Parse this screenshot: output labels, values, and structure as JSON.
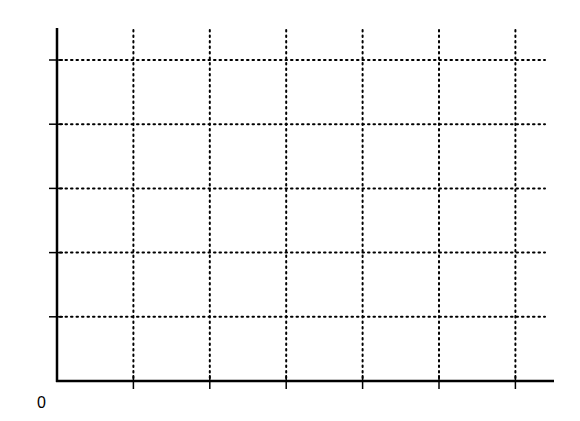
{
  "chart_data": {
    "type": "line",
    "title": "",
    "xlabel": "",
    "ylabel": "",
    "origin_label": "0",
    "x_gridlines": 6,
    "y_gridlines": 5,
    "xlim": [
      0,
      6
    ],
    "ylim": [
      0,
      5
    ],
    "grid": true,
    "grid_style": "dotted",
    "series": [],
    "axis_color": "#000000",
    "grid_color": "#000000"
  }
}
